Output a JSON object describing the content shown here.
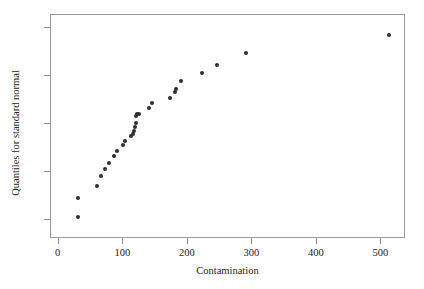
{
  "chart_data": {
    "type": "scatter",
    "title": "",
    "xlabel": "Contamination",
    "ylabel": "Quantiles for standard normal",
    "xlim": [
      -12,
      538
    ],
    "ylim": [
      -2.39,
      2.27
    ],
    "xticks": [
      0,
      100,
      200,
      300,
      400,
      500
    ],
    "xtick_labels": [
      "0",
      "100",
      "200",
      "300",
      "400",
      "500"
    ],
    "yticks": [
      2,
      1,
      0,
      -1,
      -2
    ],
    "ytick_labels": [
      "2",
      "1",
      "0",
      "−1",
      "−2"
    ],
    "grid": false,
    "legend": null,
    "marker": {
      "shape": "circle",
      "color": "#2e2e2e",
      "size_px": 4
    },
    "frame_color": "#9a9a9a",
    "background": "#ffffff",
    "x": [
      30,
      30,
      60,
      65,
      72,
      78,
      85,
      90,
      100,
      103,
      112,
      115,
      117,
      118,
      119,
      120,
      122,
      125,
      140,
      145,
      172,
      180,
      182,
      190,
      222,
      245,
      290,
      512
    ],
    "y": [
      -1.93,
      -1.53,
      -1.28,
      -1.08,
      -0.93,
      -0.8,
      -0.67,
      -0.56,
      -0.43,
      -0.36,
      -0.25,
      -0.21,
      -0.15,
      -0.06,
      0.02,
      0.17,
      0.22,
      0.22,
      0.33,
      0.43,
      0.55,
      0.67,
      0.74,
      0.9,
      1.07,
      1.24,
      1.48,
      1.86
    ],
    "n_points": 28
  }
}
